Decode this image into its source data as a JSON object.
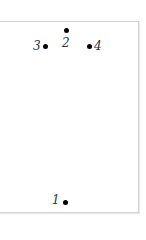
{
  "diagram": {
    "points": [
      {
        "id": "1",
        "label": "1"
      },
      {
        "id": "2",
        "label": "2"
      },
      {
        "id": "3",
        "label": "3"
      },
      {
        "id": "4",
        "label": "4"
      }
    ],
    "colors": {
      "dot": "#000000",
      "border": "#d4d4d4",
      "label": "#333333"
    }
  }
}
